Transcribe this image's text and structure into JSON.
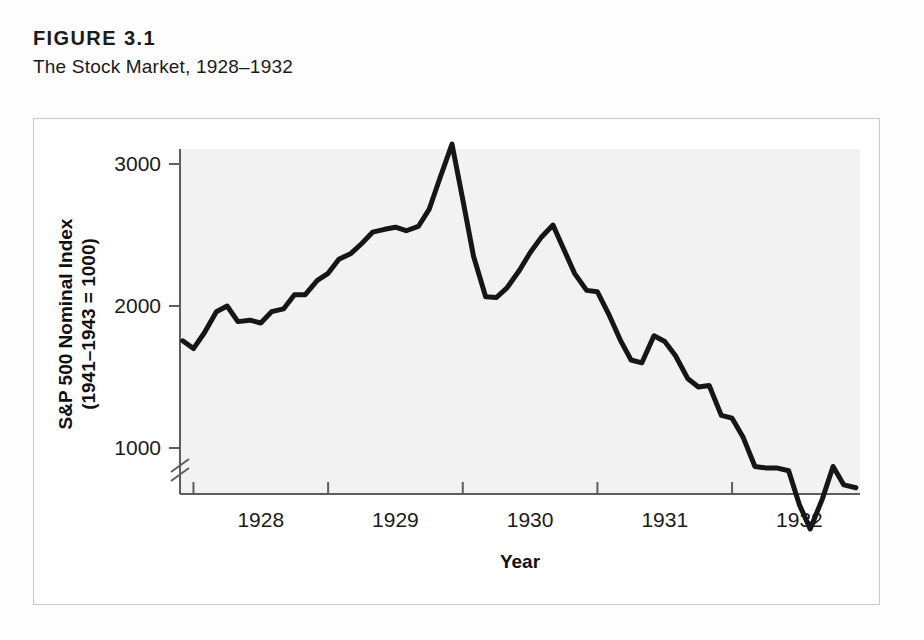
{
  "figure": {
    "number": "FIGURE 3.1",
    "subtitle": "The Stock Market, 1928–1932"
  },
  "chart_data": {
    "type": "line",
    "title": "The Stock Market, 1928–1932",
    "xlabel": "Year",
    "ylabel": "S&P 500 Nominal Index (1941–1943 = 1000)",
    "ylabel_line1": "S&P 500 Nominal Index",
    "ylabel_line2": "(1941–1943 = 1000)",
    "xlim": [
      1927.9,
      1932.95
    ],
    "ylim": [
      300,
      3250
    ],
    "y_axis_break": true,
    "y_axis_break_below": 1000,
    "grid": false,
    "legend": null,
    "xticks": [
      1928,
      1929,
      1930,
      1931,
      1932
    ],
    "xtick_labels": [
      "1928",
      "1929",
      "1930",
      "1931",
      "1932"
    ],
    "yticks": [
      1000,
      2000,
      3000
    ],
    "ytick_labels": [
      "1000",
      "2000",
      "3000"
    ],
    "line_color": "#161616",
    "line_width": 5,
    "series_name": "S&P 500 Nominal Index",
    "x": [
      1927.92,
      1928.0,
      1928.08,
      1928.17,
      1928.25,
      1928.33,
      1928.42,
      1928.5,
      1928.58,
      1928.67,
      1928.75,
      1928.83,
      1928.92,
      1929.0,
      1929.08,
      1929.17,
      1929.25,
      1929.33,
      1929.42,
      1929.5,
      1929.58,
      1929.67,
      1929.75,
      1929.83,
      1929.92,
      1930.0,
      1930.08,
      1930.17,
      1930.25,
      1930.33,
      1930.42,
      1930.5,
      1930.58,
      1930.67,
      1930.75,
      1930.83,
      1930.92,
      1931.0,
      1931.08,
      1931.17,
      1931.25,
      1931.33,
      1931.42,
      1931.5,
      1931.58,
      1931.67,
      1931.75,
      1931.83,
      1931.92,
      1932.0,
      1932.08,
      1932.17,
      1932.25,
      1932.33,
      1932.42,
      1932.5,
      1932.58,
      1932.67,
      1932.75,
      1932.83,
      1932.92
    ],
    "values": [
      1755,
      1700,
      1810,
      1960,
      2000,
      1890,
      1900,
      1880,
      1960,
      1980,
      2080,
      2080,
      2180,
      2230,
      2330,
      2370,
      2440,
      2520,
      2540,
      2555,
      2530,
      2560,
      2680,
      2900,
      3140,
      2750,
      2350,
      2065,
      2060,
      2130,
      2250,
      2375,
      2480,
      2570,
      2400,
      2230,
      2110,
      2100,
      1950,
      1760,
      1620,
      1600,
      1790,
      1750,
      1650,
      1490,
      1430,
      1440,
      1230,
      1210,
      1080,
      870,
      860,
      860,
      840,
      600,
      430,
      640,
      870,
      740,
      720
    ],
    "annotations": {
      "peak_label": "Peak: 3140 (late 1929)",
      "trough_label": "Trough: 430 (mid 1932)"
    }
  }
}
